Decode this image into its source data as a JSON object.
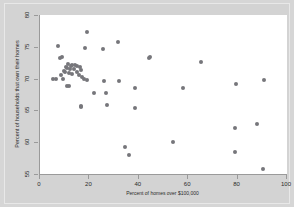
{
  "chart_data": {
    "type": "scatter",
    "title": "",
    "xlabel": "Percent of homes over $100,000",
    "ylabel": "Percent of households that own their homes",
    "xlim": [
      0,
      100
    ],
    "ylim": [
      55,
      80
    ],
    "xticks": [
      0,
      20,
      40,
      60,
      80,
      100
    ],
    "yticks": [
      55,
      60,
      65,
      70,
      75,
      80
    ],
    "grid": false,
    "legend": null,
    "marker_color": "#76767b",
    "plot_background": "#ffffff",
    "figure_background": "#d3d3d3",
    "points": [
      {
        "x": 19.0,
        "y": 77.4
      },
      {
        "x": 31.5,
        "y": 75.8
      },
      {
        "x": 7.2,
        "y": 75.1
      },
      {
        "x": 18.4,
        "y": 74.8
      },
      {
        "x": 25.4,
        "y": 74.6
      },
      {
        "x": 9.0,
        "y": 73.4
      },
      {
        "x": 8.2,
        "y": 73.2
      },
      {
        "x": 44.6,
        "y": 73.4
      },
      {
        "x": 44.0,
        "y": 73.2
      },
      {
        "x": 65.0,
        "y": 72.6
      },
      {
        "x": 11.4,
        "y": 72.3
      },
      {
        "x": 13.0,
        "y": 72.2
      },
      {
        "x": 14.2,
        "y": 72.2
      },
      {
        "x": 12.4,
        "y": 72.0
      },
      {
        "x": 15.0,
        "y": 72.0
      },
      {
        "x": 10.6,
        "y": 71.9
      },
      {
        "x": 16.0,
        "y": 71.8
      },
      {
        "x": 11.0,
        "y": 71.6
      },
      {
        "x": 12.0,
        "y": 71.5
      },
      {
        "x": 13.6,
        "y": 71.5
      },
      {
        "x": 16.8,
        "y": 71.4
      },
      {
        "x": 9.6,
        "y": 71.2
      },
      {
        "x": 10.2,
        "y": 71.1
      },
      {
        "x": 14.8,
        "y": 71.0
      },
      {
        "x": 11.8,
        "y": 70.9
      },
      {
        "x": 12.8,
        "y": 70.8
      },
      {
        "x": 8.6,
        "y": 70.6
      },
      {
        "x": 15.6,
        "y": 70.5
      },
      {
        "x": 17.2,
        "y": 70.2
      },
      {
        "x": 5.4,
        "y": 70.0
      },
      {
        "x": 6.6,
        "y": 70.0
      },
      {
        "x": 9.2,
        "y": 70.0
      },
      {
        "x": 18.0,
        "y": 69.9
      },
      {
        "x": 19.2,
        "y": 69.8
      },
      {
        "x": 90.8,
        "y": 69.8
      },
      {
        "x": 31.8,
        "y": 69.7
      },
      {
        "x": 25.8,
        "y": 69.6
      },
      {
        "x": 79.4,
        "y": 69.2
      },
      {
        "x": 10.8,
        "y": 68.9
      },
      {
        "x": 11.6,
        "y": 68.8
      },
      {
        "x": 38.4,
        "y": 68.5
      },
      {
        "x": 57.8,
        "y": 68.5
      },
      {
        "x": 21.8,
        "y": 67.8
      },
      {
        "x": 26.6,
        "y": 67.8
      },
      {
        "x": 38.6,
        "y": 65.3
      },
      {
        "x": 27.0,
        "y": 65.8
      },
      {
        "x": 16.4,
        "y": 65.7
      },
      {
        "x": 16.8,
        "y": 65.5
      },
      {
        "x": 87.8,
        "y": 62.9
      },
      {
        "x": 79.0,
        "y": 62.2
      },
      {
        "x": 54.0,
        "y": 60.1
      },
      {
        "x": 34.6,
        "y": 59.2
      },
      {
        "x": 78.8,
        "y": 58.5
      },
      {
        "x": 36.2,
        "y": 58.0
      },
      {
        "x": 90.4,
        "y": 55.8
      }
    ]
  }
}
